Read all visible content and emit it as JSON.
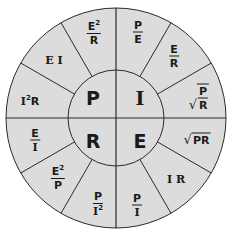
{
  "diagram": {
    "colors": {
      "fill": "#dcdcdc",
      "stroke": "#2a2a2a",
      "text": "#1a1a1a"
    },
    "center": {
      "P": "P",
      "I": "I",
      "R": "R",
      "E": "E"
    },
    "segments": {
      "P": [
        {
          "type": "text",
          "text": "I",
          "sup": "2",
          "tail": "R"
        },
        {
          "type": "text",
          "text": "E I"
        },
        {
          "type": "frac",
          "num": "E",
          "num_sup": "2",
          "den": "R"
        }
      ],
      "I": [
        {
          "type": "frac",
          "num": "P",
          "den": "E"
        },
        {
          "type": "frac",
          "num": "E",
          "den": "R"
        },
        {
          "type": "sqrtfrac",
          "num": "P",
          "den": "R"
        }
      ],
      "E": [
        {
          "type": "sqrt",
          "text": "PR"
        },
        {
          "type": "text",
          "text": "I R"
        },
        {
          "type": "frac",
          "num": "P",
          "den": "I"
        }
      ],
      "R": [
        {
          "type": "frac",
          "num": "P",
          "den": "I",
          "den_sup": "2"
        },
        {
          "type": "frac",
          "num": "E",
          "num_sup": "2",
          "den": "P"
        },
        {
          "type": "frac",
          "num": "E",
          "den": "I"
        }
      ]
    },
    "symbols": {
      "radical": "√",
      "squared": "2"
    }
  }
}
